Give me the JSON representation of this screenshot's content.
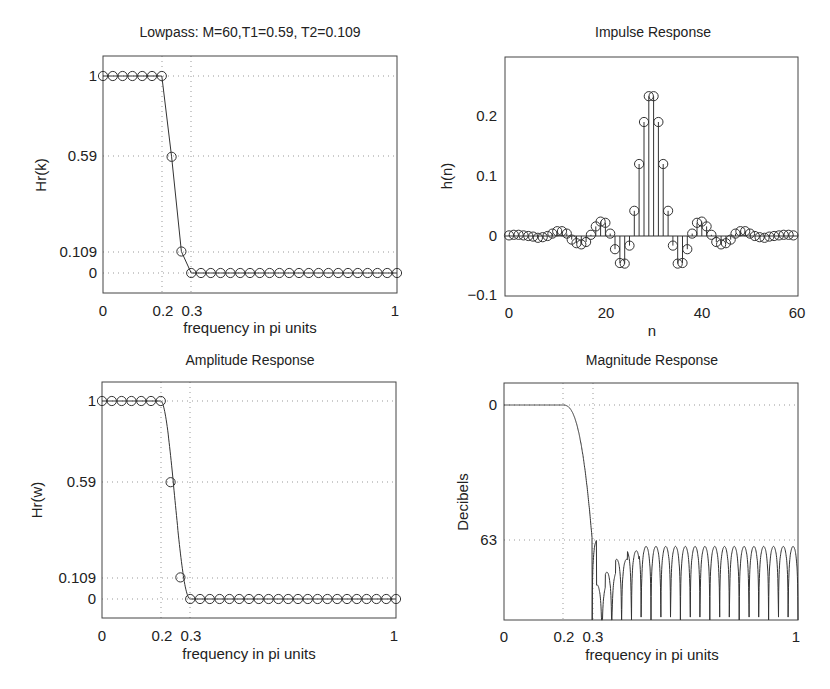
{
  "chart_data": [
    {
      "type": "line",
      "title": "Lowpass: M=60,T1=0.59, T2=0.109",
      "xlabel": "frequency in pi units",
      "ylabel": "Hr(k)",
      "xticks": [
        "0",
        "0.2",
        "0.3",
        "1"
      ],
      "yticks": [
        "0",
        "0.109",
        "0.59",
        "1"
      ],
      "xlim": [
        0,
        1
      ],
      "ylim": [
        -0.1,
        1.1
      ],
      "grid": true,
      "marker": "circle",
      "x": [
        0,
        0.0333,
        0.0667,
        0.1,
        0.1333,
        0.1667,
        0.2,
        0.2333,
        0.2667,
        0.3,
        0.3333,
        0.3667,
        0.4,
        0.4333,
        0.4667,
        0.5,
        0.5333,
        0.5667,
        0.6,
        0.6333,
        0.6667,
        0.7,
        0.7333,
        0.7667,
        0.8,
        0.8333,
        0.8667,
        0.9,
        0.9333,
        0.9667,
        1
      ],
      "values": [
        1,
        1,
        1,
        1,
        1,
        1,
        1,
        0.59,
        0.109,
        0,
        0,
        0,
        0,
        0,
        0,
        0,
        0,
        0,
        0,
        0,
        0,
        0,
        0,
        0,
        0,
        0,
        0,
        0,
        0,
        0,
        0
      ]
    },
    {
      "type": "stem",
      "title": "Impulse Response",
      "xlabel": "n",
      "ylabel": "h(n)",
      "xticks": [
        "0",
        "20",
        "40",
        "60"
      ],
      "yticks": [
        "-0.1",
        "0",
        "0.1",
        "0.2"
      ],
      "xlim": [
        -1,
        60
      ],
      "ylim": [
        -0.1,
        0.3
      ],
      "grid": false,
      "x": [
        0,
        1,
        2,
        3,
        4,
        5,
        6,
        7,
        8,
        9,
        10,
        11,
        12,
        13,
        14,
        15,
        16,
        17,
        18,
        19,
        20,
        21,
        22,
        23,
        24,
        25,
        26,
        27,
        28,
        29,
        30,
        31,
        32,
        33,
        34,
        35,
        36,
        37,
        38,
        39,
        40,
        41,
        42,
        43,
        44,
        45,
        46,
        47,
        48,
        49,
        50,
        51,
        52,
        53,
        54,
        55,
        56,
        57,
        58,
        59
      ],
      "values": [
        0.001,
        0.002,
        0.002,
        0.001,
        0,
        -0.001,
        -0.003,
        -0.002,
        0,
        0.004,
        0.008,
        0.008,
        0.004,
        -0.006,
        -0.012,
        -0.014,
        -0.01,
        0.002,
        0.016,
        0.024,
        0.022,
        0.004,
        -0.022,
        -0.045,
        -0.046,
        -0.016,
        0.042,
        0.12,
        0.19,
        0.233,
        0.233,
        0.19,
        0.12,
        0.042,
        -0.016,
        -0.046,
        -0.045,
        -0.022,
        0.004,
        0.022,
        0.024,
        0.016,
        0.002,
        -0.01,
        -0.014,
        -0.012,
        -0.006,
        0.004,
        0.008,
        0.008,
        0.004,
        0,
        -0.002,
        -0.003,
        -0.001,
        0,
        0.001,
        0.002,
        0.002,
        0.001
      ]
    },
    {
      "type": "line",
      "title": "Amplitude Response",
      "xlabel": "frequency in pi units",
      "ylabel": "Hr(w)",
      "xticks": [
        "0",
        "0.2",
        "0.3",
        "1"
      ],
      "yticks": [
        "0",
        "0.109",
        "0.59",
        "1"
      ],
      "xlim": [
        0,
        1
      ],
      "ylim": [
        -0.1,
        1.1
      ],
      "grid": true,
      "marker": "circle (samples) + smooth curve",
      "x": [
        0,
        0.0333,
        0.0667,
        0.1,
        0.1333,
        0.1667,
        0.2,
        0.2333,
        0.2667,
        0.3,
        0.3333,
        0.3667,
        0.4,
        0.4333,
        0.4667,
        0.5,
        0.5333,
        0.5667,
        0.6,
        0.6333,
        0.6667,
        0.7,
        0.7333,
        0.7667,
        0.8,
        0.8333,
        0.8667,
        0.9,
        0.9333,
        0.9667,
        1
      ],
      "values": [
        1,
        1,
        1,
        1,
        1,
        1,
        1,
        0.59,
        0.109,
        0,
        0,
        0,
        0,
        0,
        0,
        0,
        0,
        0,
        0,
        0,
        0,
        0,
        0,
        0,
        0,
        0,
        0,
        0,
        0,
        0,
        0
      ]
    },
    {
      "type": "line",
      "title": "Magnitude Response",
      "xlabel": "frequency in pi units",
      "ylabel": "Decibels",
      "xticks": [
        "0",
        "0.2",
        "0.3",
        "1"
      ],
      "yticks": [
        "0",
        "63"
      ],
      "xlim": [
        0,
        1
      ],
      "ylim": [
        -110,
        10
      ],
      "grid": true,
      "notes": "passband flat at 0 dB until 0.2, rolls off steeply to about -63 dB near 0.3; stopband lobes peak near -63 to -66 dB with nulls reaching the bottom axis",
      "x": [
        0,
        0.1,
        0.2,
        0.25,
        0.3,
        0.32,
        0.35,
        0.4,
        0.5,
        0.6,
        0.7,
        0.8,
        0.9,
        1
      ],
      "values": [
        0,
        0,
        0,
        -20,
        -63,
        -75,
        -85,
        -70,
        -66,
        -65,
        -65,
        -65,
        -66,
        -66
      ]
    }
  ],
  "plots": {
    "tl": {
      "title": "Lowpass: M=60,T1=0.59, T2=0.109",
      "ylabel": "Hr(k)",
      "xlabel": "frequency in pi units",
      "yt": [
        "1",
        "0.59",
        "0.109",
        "0"
      ],
      "xt": [
        "0",
        "0.2",
        "0.3",
        "1"
      ]
    },
    "tr": {
      "title": "Impulse Response",
      "ylabel": "h(n)",
      "xlabel": "n",
      "yt": [
        "0.2",
        "0.1",
        "0",
        "−0.1"
      ],
      "xt": [
        "0",
        "20",
        "40",
        "60"
      ]
    },
    "bl": {
      "title": "Amplitude Response",
      "ylabel": "Hr(w)",
      "xlabel": "frequency in pi units",
      "yt": [
        "1",
        "0.59",
        "0.109",
        "0"
      ],
      "xt": [
        "0",
        "0.2",
        "0.3",
        "1"
      ]
    },
    "br": {
      "title": "Magnitude Response",
      "ylabel": "Decibels",
      "xlabel": "frequency in pi units",
      "yt": [
        "0",
        "63"
      ],
      "xt": [
        "0",
        "0.2",
        "0.3",
        "1"
      ]
    }
  }
}
